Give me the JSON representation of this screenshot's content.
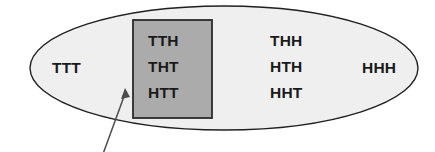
{
  "diagram": {
    "sample_space": {
      "name": "sample-space-ellipse",
      "shape": "ellipse",
      "fill_color": "#efefef",
      "stroke_color": "#1f1f1f",
      "center_x": 224,
      "center_y": 68,
      "radius_x": 194,
      "radius_y": 62
    },
    "event_box": {
      "name": "highlighted-event-rectangle",
      "shape": "rectangle",
      "fill_color": "#ababab",
      "stroke_color": "#2b2b2b",
      "x": 133,
      "y": 20,
      "width": 79,
      "height": 98
    },
    "pointer": {
      "name": "callout-arrow",
      "stroke_color": "#4d4d4d",
      "tail_x": 103,
      "tail_y": 152,
      "tip_x": 125,
      "tip_y": 89
    },
    "outcomes": [
      {
        "label": "TTT",
        "x": 52,
        "y": 73,
        "group": "outside-left"
      },
      {
        "label": "TTH",
        "x": 148,
        "y": 46,
        "group": "highlighted"
      },
      {
        "label": "THT",
        "x": 148,
        "y": 72,
        "group": "highlighted"
      },
      {
        "label": "HTT",
        "x": 148,
        "y": 98,
        "group": "highlighted"
      },
      {
        "label": "THH",
        "x": 270,
        "y": 46,
        "group": "outside-right"
      },
      {
        "label": "HTH",
        "x": 270,
        "y": 72,
        "group": "outside-right"
      },
      {
        "label": "HHT",
        "x": 270,
        "y": 98,
        "group": "outside-right"
      },
      {
        "label": "HHH",
        "x": 362,
        "y": 73,
        "group": "outside-far-right"
      }
    ]
  }
}
